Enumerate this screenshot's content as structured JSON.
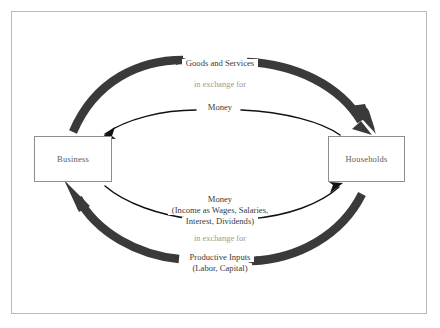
{
  "diagram": {
    "nodes": [
      {
        "id": "business",
        "label": "Business"
      },
      {
        "id": "households",
        "label": "Households"
      }
    ],
    "outer_flow_top": {
      "item": "Goods and Services",
      "connector": "in exchange for",
      "direction": "households-to-business"
    },
    "inner_flow_top": {
      "item": "Money",
      "direction": "households-to-business"
    },
    "inner_flow_bottom": {
      "item": "Money",
      "detail_line_1": "(Income as Wages, Salaries,",
      "detail_line_2": "Interest, Dividends)",
      "direction": "business-to-households"
    },
    "outer_flow_bottom": {
      "connector": "in exchange for",
      "item": "Productive Inputs",
      "detail": "(Labor, Capital)",
      "direction": "business-to-households"
    },
    "colors": {
      "thick_arrow": "#3a3a3a",
      "thin_arrow": "#111111",
      "box_border": "#8e8e8e",
      "box_label": "#5d5d5d",
      "frame_border": "#b9b9b9",
      "strong_text": "#3a3a3a",
      "faint_text": "#9a9a9a",
      "background": "#ffffff"
    }
  }
}
